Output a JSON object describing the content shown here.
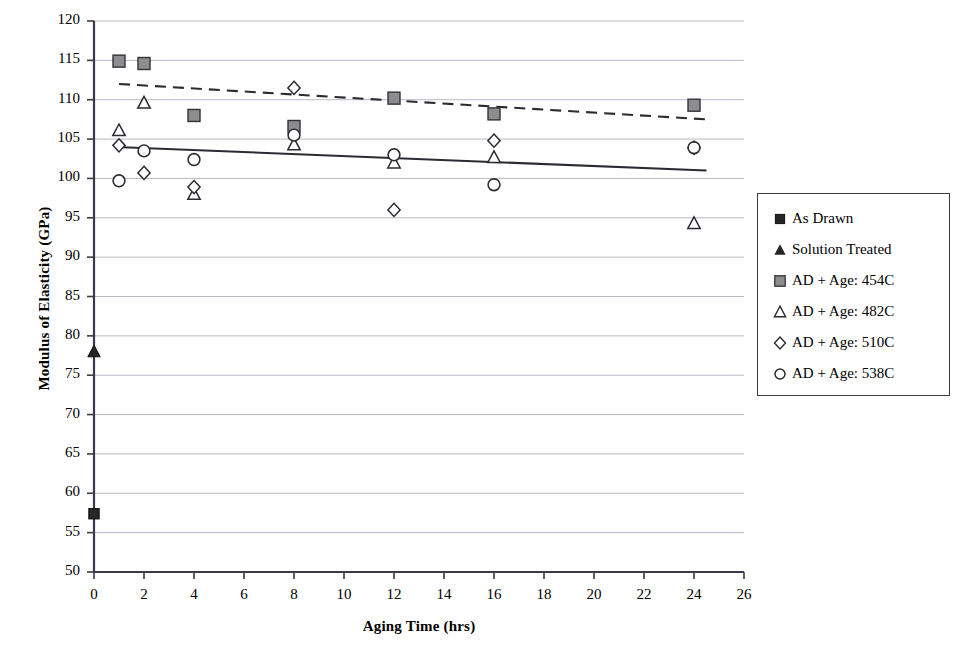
{
  "chart_data": {
    "type": "scatter",
    "title": "",
    "xlabel": "Aging Time (hrs)",
    "ylabel": "Modulus of Elasticity (GPa)",
    "xlim": [
      0,
      26
    ],
    "ylim": [
      50,
      120
    ],
    "xticks": [
      0,
      2,
      4,
      6,
      8,
      10,
      12,
      14,
      16,
      18,
      20,
      22,
      24,
      26
    ],
    "yticks": [
      50,
      55,
      60,
      65,
      70,
      75,
      80,
      85,
      90,
      95,
      100,
      105,
      110,
      115,
      120
    ],
    "grid": "horizontal",
    "legend_position": "right-outside",
    "series": [
      {
        "name": "As Drawn",
        "marker": "filled-square",
        "color": "#1a1a1a",
        "points": [
          {
            "x": 0,
            "y": 57.4
          }
        ]
      },
      {
        "name": "Solution Treated",
        "marker": "filled-triangle",
        "color": "#1a1a1a",
        "points": [
          {
            "x": 0,
            "y": 78.0
          }
        ]
      },
      {
        "name": "AD + Age: 454C",
        "marker": "gray-square",
        "color": "#8a8a8a",
        "points": [
          {
            "x": 1,
            "y": 114.9
          },
          {
            "x": 2,
            "y": 114.6
          },
          {
            "x": 4,
            "y": 108.0
          },
          {
            "x": 8,
            "y": 106.6
          },
          {
            "x": 12,
            "y": 110.2
          },
          {
            "x": 16,
            "y": 108.2
          },
          {
            "x": 24,
            "y": 109.3
          }
        ]
      },
      {
        "name": "AD + Age: 482C",
        "marker": "open-triangle",
        "color": "#1a1a1a",
        "points": [
          {
            "x": 1,
            "y": 106.1
          },
          {
            "x": 2,
            "y": 109.6
          },
          {
            "x": 4,
            "y": 98.0
          },
          {
            "x": 8,
            "y": 104.3
          },
          {
            "x": 12,
            "y": 102.0
          },
          {
            "x": 16,
            "y": 102.7
          },
          {
            "x": 24,
            "y": 94.3
          }
        ]
      },
      {
        "name": "AD + Age: 510C",
        "marker": "open-diamond",
        "color": "#1a1a1a",
        "points": [
          {
            "x": 1,
            "y": 104.2
          },
          {
            "x": 2,
            "y": 100.7
          },
          {
            "x": 4,
            "y": 98.9
          },
          {
            "x": 8,
            "y": 111.5
          },
          {
            "x": 12,
            "y": 96.0
          },
          {
            "x": 16,
            "y": 104.8
          },
          {
            "x": 24,
            "y": 103.9
          }
        ]
      },
      {
        "name": "AD + Age: 538C",
        "marker": "open-circle",
        "color": "#1a1a1a",
        "points": [
          {
            "x": 1,
            "y": 99.7
          },
          {
            "x": 2,
            "y": 103.5
          },
          {
            "x": 4,
            "y": 102.4
          },
          {
            "x": 8,
            "y": 105.5
          },
          {
            "x": 12,
            "y": 103.0
          },
          {
            "x": 16,
            "y": 99.2
          },
          {
            "x": 24,
            "y": 103.9
          }
        ]
      }
    ],
    "trendlines": [
      {
        "name": "upper-dashed-trendline",
        "style": "dashed",
        "x1": 1,
        "y1": 112.0,
        "x2": 24.5,
        "y2": 107.5
      },
      {
        "name": "lower-solid-trendline",
        "style": "solid",
        "x1": 0.9,
        "y1": 104.0,
        "x2": 24.5,
        "y2": 101.0
      }
    ]
  },
  "axes": {
    "x_label": "Aging Time (hrs)",
    "y_label": "Modulus of Elasticity (GPa)",
    "x_tick_labels": [
      "0",
      "2",
      "4",
      "6",
      "8",
      "10",
      "12",
      "14",
      "16",
      "18",
      "20",
      "22",
      "24",
      "26"
    ],
    "y_tick_labels": [
      "120",
      "115",
      "110",
      "105",
      "100",
      "95",
      "90",
      "85",
      "80",
      "75",
      "70",
      "65",
      "60",
      "55",
      "50"
    ]
  },
  "legend": {
    "items": [
      {
        "label": "As Drawn",
        "marker": "filled-square"
      },
      {
        "label": "Solution Treated",
        "marker": "filled-triangle"
      },
      {
        "label": "AD + Age: 454C",
        "marker": "gray-square"
      },
      {
        "label": "AD + Age: 482C",
        "marker": "open-triangle"
      },
      {
        "label": "AD + Age: 510C",
        "marker": "open-diamond"
      },
      {
        "label": "AD + Age: 538C",
        "marker": "open-circle"
      }
    ]
  },
  "colors": {
    "axis": "#3a3a4a",
    "grid": "#b9b9c4",
    "marker_fill_dark": "#262626",
    "marker_fill_gray": "#8d8d8d",
    "marker_stroke": "#2a2a33"
  }
}
